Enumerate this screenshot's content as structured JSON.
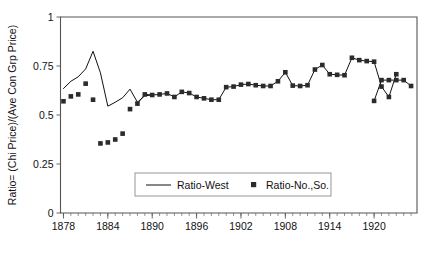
{
  "chart_data": {
    "type": "line",
    "title": "",
    "xlabel": "",
    "ylabel": "Ratio= (Chi Price)/(Ave Con Grp Price)",
    "xlim": [
      1877.6,
      1925.8
    ],
    "ylim": [
      0,
      1
    ],
    "grid": false,
    "legend_position": "inside-bottom-center",
    "y_ticks": [
      "0",
      "0.25",
      "0.5",
      "0.75",
      "1"
    ],
    "y_tick_values": [
      0,
      0.25,
      0.5,
      0.75,
      1
    ],
    "x_ticks": [
      "1878",
      "1884",
      "1890",
      "1896",
      "1902",
      "1908",
      "1914",
      "1920"
    ],
    "x_tick_values": [
      1878,
      1884,
      1890,
      1896,
      1902,
      1908,
      1914,
      1920
    ],
    "x_minor_tick_step": 1,
    "series": [
      {
        "name": "Ratio-West",
        "style": "line",
        "x": [
          1878,
          1879,
          1880,
          1881,
          1882,
          1883,
          1884,
          1885,
          1886,
          1887,
          1888,
          1889,
          1890
        ],
        "values": [
          0.635,
          0.672,
          0.695,
          0.735,
          0.825,
          0.715,
          0.545,
          0.565,
          0.588,
          0.632,
          0.565,
          0.598,
          0.602
        ]
      },
      {
        "name": "Ratio-No.,So.",
        "style": "marker",
        "x": [
          1878,
          1879,
          1880,
          1881,
          1882,
          1883,
          1884,
          1885,
          1886,
          1887,
          1888,
          1889,
          1890,
          1891,
          1892,
          1893,
          1894,
          1895,
          1896,
          1897,
          1898,
          1899,
          1900,
          1901,
          1902,
          1903,
          1904,
          1905,
          1906,
          1907,
          1908,
          1909,
          1910,
          1911,
          1912,
          1913,
          1914,
          1915,
          1916,
          1917,
          1918,
          1919,
          1920,
          1921,
          1922,
          1923
        ],
        "values": [
          0.57,
          0.595,
          0.605,
          0.66,
          0.578,
          0.355,
          0.36,
          0.375,
          0.405,
          0.53,
          0.558,
          0.605,
          0.602,
          0.605,
          0.61,
          0.592,
          0.618,
          0.612,
          0.592,
          0.585,
          0.578,
          0.578,
          0.642,
          0.645,
          0.655,
          0.658,
          0.652,
          0.648,
          0.648,
          0.672,
          0.718,
          0.65,
          0.648,
          0.652,
          0.732,
          0.755,
          0.708,
          0.705,
          0.703,
          0.792,
          0.78,
          0.775,
          0.772,
          0.645,
          0.592,
          0.708
        ]
      }
    ],
    "extra_markers": {
      "note": "second half of marker series continues to right edge",
      "x": [
        1920,
        1921,
        1922,
        1923,
        1924,
        1925
      ],
      "values": [
        0.572,
        0.678,
        0.678,
        0.678,
        0.678,
        0.648
      ]
    }
  },
  "legend": {
    "entries": [
      {
        "label": "Ratio-West",
        "marker": "line"
      },
      {
        "label": "Ratio-No.,So.",
        "marker": "square"
      }
    ]
  },
  "colors": {
    "line": "#111111",
    "marker": "#2b2b2b",
    "axis": "#555555",
    "background": "#ffffff"
  }
}
